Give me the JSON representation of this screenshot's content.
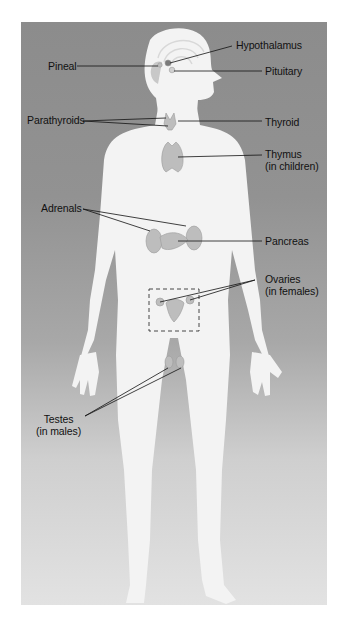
{
  "figure": {
    "colors": {
      "background_top": "#8c8c8c",
      "background_bottom": "#e2e2e2",
      "body": "#f2f2f2",
      "gland": "#bdbdbd",
      "leader_line": "#111111"
    }
  },
  "labels": {
    "hypothalamus": "Hypothalamus",
    "pineal": "Pineal",
    "pituitary": "Pituitary",
    "parathyroids": "Parathyroids",
    "thyroid": "Thyroid",
    "thymus_line1": "Thymus",
    "thymus_line2": "(in children)",
    "adrenals": "Adrenals",
    "pancreas": "Pancreas",
    "ovaries_line1": "Ovaries",
    "ovaries_line2": "(in females)",
    "testes_line1": "Testes",
    "testes_line2": "(in males)"
  }
}
